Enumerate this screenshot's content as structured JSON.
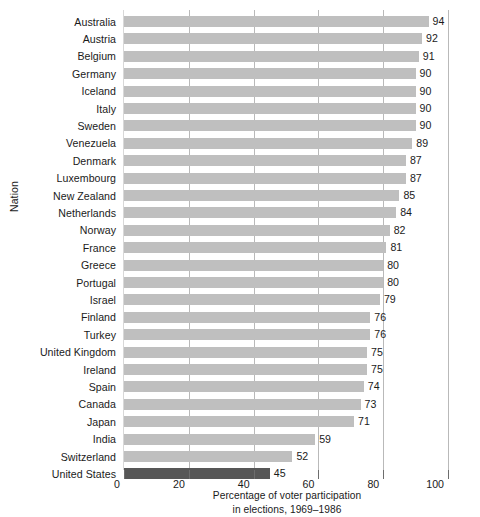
{
  "chart_data": {
    "type": "bar",
    "orientation": "horizontal",
    "title": "",
    "xlabel": "Percentage of voter participation in elections, 1969–1986",
    "ylabel": "Nation",
    "xlim": [
      0,
      100
    ],
    "xticks": [
      0,
      20,
      40,
      60,
      80,
      100
    ],
    "grid": "vertical",
    "legend": "none",
    "categories": [
      "Australia",
      "Austria",
      "Belgium",
      "Germany",
      "Iceland",
      "Italy",
      "Sweden",
      "Venezuela",
      "Denmark",
      "Luxembourg",
      "New Zealand",
      "Netherlands",
      "Norway",
      "France",
      "Greece",
      "Portugal",
      "Israel",
      "Finland",
      "Turkey",
      "United Kingdom",
      "Ireland",
      "Spain",
      "Canada",
      "Japan",
      "India",
      "Switzerland",
      "United States"
    ],
    "values": [
      94,
      92,
      91,
      90,
      90,
      90,
      90,
      89,
      87,
      87,
      85,
      84,
      82,
      81,
      80,
      80,
      79,
      76,
      76,
      75,
      75,
      74,
      73,
      71,
      59,
      52,
      45
    ],
    "highlighted_category": "United States",
    "bar_color": "#bfbfbf",
    "highlight_color": "#575757"
  },
  "axis": {
    "y_title": "Nation",
    "x_tick_labels": [
      "0",
      "20",
      "40",
      "60",
      "80",
      "100"
    ]
  },
  "caption": {
    "line1": "Percentage of voter participation",
    "line2": "in elections, 1969–1986"
  }
}
